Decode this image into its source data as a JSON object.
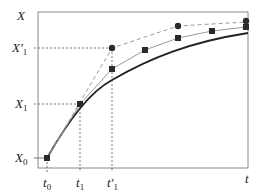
{
  "diagram": {
    "type": "convergence-plot",
    "y_axis_label": "X",
    "x_axis_label": "t",
    "y_ticks": [
      {
        "name": "X0",
        "base": "X",
        "sub": "0",
        "y": 158
      },
      {
        "name": "X1",
        "base": "X",
        "sub": "1",
        "y": 104
      },
      {
        "name": "X'1",
        "base": "X'",
        "sub": "1",
        "y": 48
      }
    ],
    "x_ticks": [
      {
        "name": "t0",
        "base": "t",
        "sub": "0",
        "x": 47
      },
      {
        "name": "t1",
        "base": "t",
        "sub": "1",
        "x": 80
      },
      {
        "name": "t'1",
        "base": "t'",
        "sub": "1",
        "x": 112
      }
    ],
    "series": [
      {
        "name": "exact-solution",
        "style": "solid-thick",
        "color": "#222222"
      },
      {
        "name": "square-markers-approximation",
        "style": "solid-thin",
        "color": "#999999",
        "marker": "square",
        "points": [
          [
            47,
            158
          ],
          [
            80,
            104
          ],
          [
            112,
            69
          ],
          [
            145,
            50
          ],
          [
            178,
            38
          ],
          [
            212,
            31
          ],
          [
            246,
            27
          ]
        ]
      },
      {
        "name": "circle-markers-approximation",
        "style": "dashed",
        "color": "#999999",
        "marker": "circle",
        "points": [
          [
            47,
            158
          ],
          [
            112,
            48
          ],
          [
            178,
            26
          ],
          [
            246,
            22
          ]
        ]
      }
    ],
    "colors": {
      "axis": "#777777",
      "curve": "#222222",
      "guide": "#555555",
      "marker": "#222222"
    }
  }
}
